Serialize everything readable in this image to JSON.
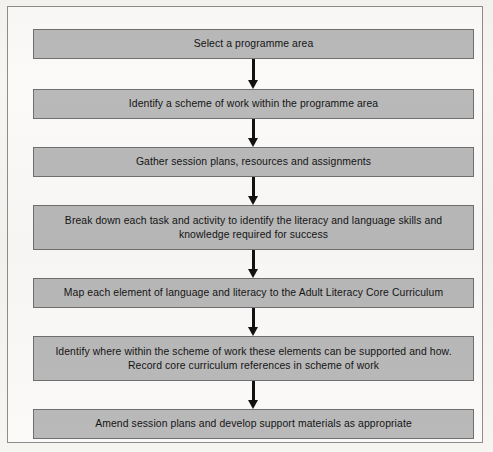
{
  "diagram": {
    "type": "flowchart",
    "orientation": "vertical-top-down",
    "colors": {
      "node_fill": "#b9b9b9",
      "node_border": "#6f6f6f",
      "text": "#141414",
      "connector": "#111111",
      "frame_border": "#8d8d8d",
      "page_background": "#f6f5f2"
    },
    "nodes": [
      {
        "id": "step-1",
        "label": "Select a programme area",
        "lines": 1
      },
      {
        "id": "step-2",
        "label": "Identify a scheme of work within the programme area",
        "lines": 1
      },
      {
        "id": "step-3",
        "label": "Gather session plans, resources and assignments",
        "lines": 1
      },
      {
        "id": "step-4",
        "label": "Break down each task and activity to identify the literacy and language skills and\nknowledge required for success",
        "lines": 2
      },
      {
        "id": "step-5",
        "label": "Map each element of language and literacy to the Adult Literacy Core Curriculum",
        "lines": 1
      },
      {
        "id": "step-6",
        "label": "Identify where within the scheme of work these elements can be supported and how.\nRecord core curriculum references in scheme of work",
        "lines": 2
      },
      {
        "id": "step-7",
        "label": "Amend session plans and develop support materials as appropriate",
        "lines": 1
      }
    ],
    "connectors": [
      {
        "id": "arrow-1-2",
        "from": "step-1",
        "to": "step-2"
      },
      {
        "id": "arrow-2-3",
        "from": "step-2",
        "to": "step-3"
      },
      {
        "id": "arrow-3-4",
        "from": "step-3",
        "to": "step-4"
      },
      {
        "id": "arrow-4-5",
        "from": "step-4",
        "to": "step-5"
      },
      {
        "id": "arrow-5-6",
        "from": "step-5",
        "to": "step-6"
      },
      {
        "id": "arrow-6-7",
        "from": "step-6",
        "to": "step-7"
      }
    ]
  }
}
